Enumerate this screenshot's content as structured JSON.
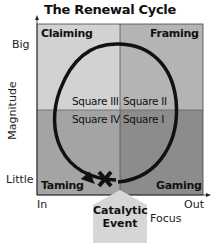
{
  "title": "The Renewal Cycle",
  "axes": {
    "y_label": "Magnitude",
    "y_top": "Big",
    "y_bottom": "Little",
    "x_label": "Focus",
    "x_left": "In",
    "x_right": "Out"
  },
  "quadrants": {
    "top_left": "Claiming",
    "top_right": "Framing",
    "bottom_left": "Taming",
    "bottom_right": "Gaming"
  },
  "squares": {
    "top_left": "Square III",
    "top_right": "Square II",
    "bottom_left": "Square IV",
    "bottom_right": "Square I"
  },
  "event": {
    "line1": "Catalytic",
    "line2": "Event",
    "marker": "X"
  },
  "colors": {
    "top_left": "#d2d2d2",
    "top_right": "#b4b4b4",
    "bottom_left": "#a4a4a4",
    "bottom_right": "#8c8c8c",
    "event": "#d6d6d6",
    "cycle": "#111111"
  }
}
